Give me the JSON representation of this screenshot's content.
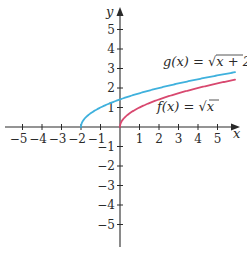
{
  "chart_data": {
    "type": "line",
    "title": "",
    "xlabel": "x",
    "ylabel": "y",
    "xlim": [
      -5.8,
      6
    ],
    "ylim": [
      -6.1,
      6
    ],
    "grid": false,
    "x_ticks": [
      -5,
      -4,
      -3,
      -2,
      -1,
      1,
      2,
      3,
      4,
      5
    ],
    "y_ticks": [
      5,
      4,
      3,
      2,
      1,
      -1,
      -2,
      -3,
      -4,
      -5
    ],
    "x_tick_labels": [
      "−5",
      "−4",
      "−3",
      "−2",
      "−1",
      "1",
      "2",
      "3",
      "4",
      "5"
    ],
    "y_tick_labels": [
      "5",
      "4",
      "3",
      "2",
      "1",
      "−1",
      "−2",
      "−3",
      "−4",
      "−5"
    ],
    "series": [
      {
        "name": "g(x) = √(x + 2)",
        "label_text": "g(x) = √x + 2",
        "color": "#3fb1dd",
        "domain": [
          -2,
          5.9
        ],
        "x": [
          -2,
          -1.5,
          -1,
          0,
          1,
          2,
          3,
          4,
          5,
          5.9
        ],
        "values": [
          0,
          0.71,
          1,
          1.41,
          1.73,
          2,
          2.24,
          2.45,
          2.65,
          2.81
        ]
      },
      {
        "name": "f(x) = √x",
        "label_text": "f(x) = √x",
        "color": "#d8486f",
        "domain": [
          0,
          5.9
        ],
        "x": [
          0,
          0.25,
          1,
          2,
          3,
          4,
          5,
          5.9
        ],
        "values": [
          0,
          0.5,
          1,
          1.41,
          1.73,
          2,
          2.24,
          2.43
        ]
      }
    ],
    "legend": "inline labels near curves"
  },
  "labels": {
    "x_axis": "x",
    "y_axis": "y",
    "g_prefix": "g(x) = ",
    "g_radicand": "x + 2",
    "f_prefix": "f(x) = ",
    "f_radicand": "x"
  },
  "colors": {
    "axis": "#2a2a2a",
    "g_curve": "#3fb1dd",
    "f_curve": "#d8486f"
  }
}
